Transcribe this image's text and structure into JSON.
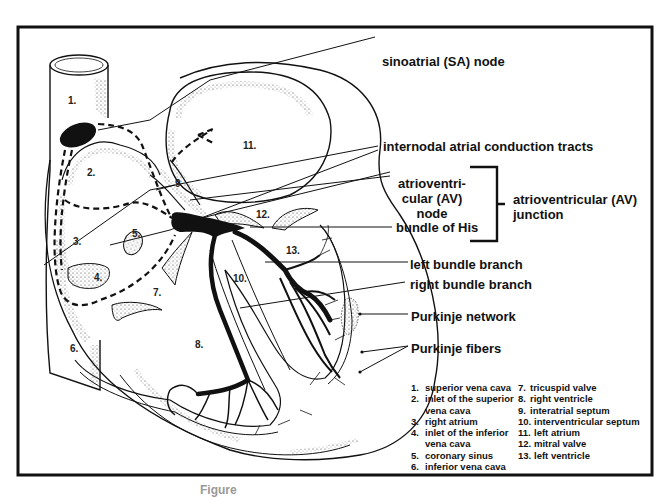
{
  "figure": {
    "frame_color": "#111111",
    "background": "#ffffff",
    "caption_partial": "Figure"
  },
  "labels": {
    "sa_node": "sinoatrial (SA) node",
    "internodal": "internodal atrial conduction tracts",
    "av_node_line1": "atrioventri-",
    "av_node_line2": "cular (AV)",
    "av_node_line3": "node",
    "bundle_his": "bundle of His",
    "av_junction_line1": "atrioventricular (AV)",
    "av_junction_line2": "junction",
    "left_bundle": "left bundle branch",
    "right_bundle": "right bundle branch",
    "purkinje_network": "Purkinje network",
    "purkinje_fibers": "Purkinje fibers"
  },
  "structure_numbers": {
    "n1": "1.",
    "n2": "2.",
    "n3": "3.",
    "n4": "4.",
    "n5": "5.",
    "n6": "6.",
    "n7": "7.",
    "n8": "8.",
    "n9": "9",
    "n10": "10.",
    "n11": "11.",
    "n12": "12.",
    "n13": "13."
  },
  "legend": {
    "left_column": [
      {
        "num": "1.",
        "text": "superior vena cava"
      },
      {
        "num": "2.",
        "text": "inlet of the superior",
        "cont": "vena cava"
      },
      {
        "num": "3.",
        "text": "right atrium"
      },
      {
        "num": "4.",
        "text": "inlet of the inferior",
        "cont": "vena cava"
      },
      {
        "num": "5.",
        "text": "coronary sinus"
      },
      {
        "num": "6.",
        "text": "inferior vena cava"
      }
    ],
    "right_column": [
      {
        "num": "7.",
        "text": "tricuspid valve"
      },
      {
        "num": "8.",
        "text": "right ventricle"
      },
      {
        "num": "9.",
        "text": "interatrial septum"
      },
      {
        "num": "10.",
        "text": "interventricular septum"
      },
      {
        "num": "11.",
        "text": "left atrium"
      },
      {
        "num": "12.",
        "text": "mitral valve"
      },
      {
        "num": "13.",
        "text": "left ventricle"
      }
    ]
  }
}
